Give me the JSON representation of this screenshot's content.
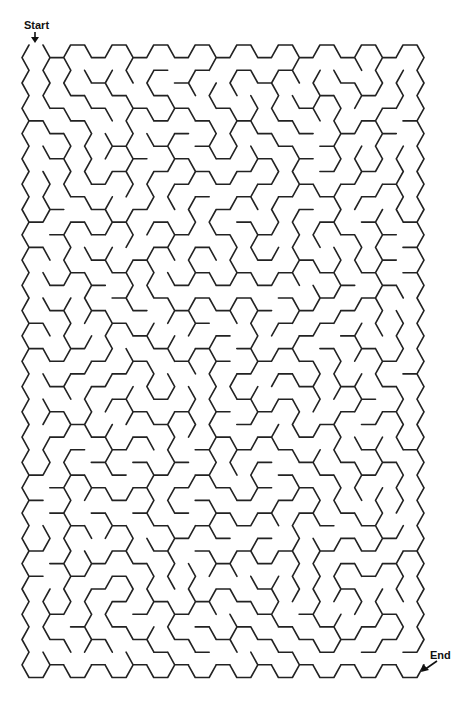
{
  "maze": {
    "type": "hexagonal",
    "columns": 19,
    "rows_even_columns": 25,
    "rows_odd_columns": 24,
    "origin_x": 22,
    "origin_y": 45,
    "hex_width": 28,
    "hex_height": 25.3,
    "col_spacing": 20.78,
    "wall_color": "#222222",
    "wall_width": 1.6,
    "seed": 20240611
  },
  "labels": {
    "start": "Start",
    "end": "End"
  }
}
